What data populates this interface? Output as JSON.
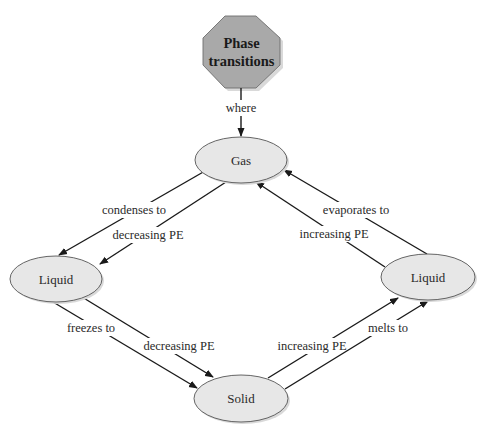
{
  "diagram": {
    "title_node": {
      "line1": "Phase",
      "line2": "transitions",
      "fill": "#a9a9a9"
    },
    "nodes": {
      "gas": {
        "label": "Gas"
      },
      "liquid_left": {
        "label": "Liquid"
      },
      "liquid_right": {
        "label": "Liquid"
      },
      "solid": {
        "label": "Solid"
      }
    },
    "edges": {
      "where": {
        "from": "Phase transitions",
        "to": "Gas",
        "label": "where"
      },
      "condenses": {
        "from": "Gas",
        "to": "Liquid (left)",
        "label": "condenses to"
      },
      "condenses_pe": {
        "from": "Gas",
        "to": "Liquid (left)",
        "label": "decreasing PE"
      },
      "evaporates": {
        "from": "Liquid (right)",
        "to": "Gas",
        "label": "evaporates to"
      },
      "evaporates_pe": {
        "from": "Liquid (right)",
        "to": "Gas",
        "label": "increasing PE"
      },
      "freezes": {
        "from": "Liquid (left)",
        "to": "Solid",
        "label": "freezes to"
      },
      "freezes_pe": {
        "from": "Liquid (left)",
        "to": "Solid",
        "label": "decreasing PE"
      },
      "melts": {
        "from": "Solid",
        "to": "Liquid (right)",
        "label": "melts to"
      },
      "melts_pe": {
        "from": "Solid",
        "to": "Liquid (right)",
        "label": "increasing PE"
      }
    },
    "colors": {
      "ellipse_fill": "#e7e7e7",
      "octagon_fill": "#a9a9a9",
      "line": "#1a1a1a",
      "text": "#2a2a2a"
    }
  }
}
